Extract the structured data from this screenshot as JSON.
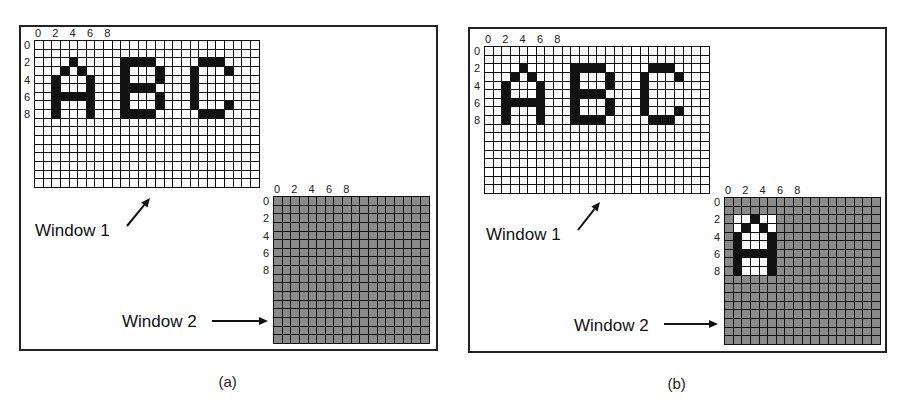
{
  "figure": {
    "panels": [
      {
        "id": "a",
        "caption": "(a)",
        "frame": {
          "x": 19,
          "y": 25,
          "w": 419,
          "h": 326
        },
        "window1": {
          "label": "Window 1",
          "x": 34,
          "y": 40,
          "cols": 26,
          "rows": 17,
          "fill": "white",
          "col_ticks": [
            "0",
            "2",
            "4",
            "6",
            "8"
          ],
          "row_ticks": [
            "0",
            "2",
            "4",
            "6",
            "8"
          ],
          "letters": [
            {
              "char": "A",
              "col": 2,
              "row": 2,
              "bitmap": [
                "..B..",
                ".B.B.",
                "B...B",
                "B...B",
                "BBBBB",
                "B...B",
                "B...B"
              ]
            },
            {
              "char": "B",
              "col": 10,
              "row": 2,
              "bitmap": [
                "BBBB.",
                "B...B",
                "B...B",
                "BBBB.",
                "B...B",
                "B...B",
                "BBBB."
              ]
            },
            {
              "char": "C",
              "col": 18,
              "row": 2,
              "bitmap": [
                ".BBB.",
                "B...B",
                "B....",
                "B....",
                "B....",
                "B...B",
                ".BBB."
              ]
            }
          ],
          "label_pos": {
            "x": 35,
            "y": 222
          },
          "arrow": {
            "x1": 127,
            "y1": 226,
            "x2": 150,
            "y2": 198
          }
        },
        "window2": {
          "label": "Window 2",
          "x": 273,
          "y": 196,
          "cols": 18,
          "rows": 17,
          "fill": "gray",
          "col_ticks": [
            "0",
            "2",
            "4",
            "6",
            "8"
          ],
          "row_ticks": [
            "0",
            "2",
            "4",
            "6",
            "8"
          ],
          "copied": null,
          "label_pos": {
            "x": 122,
            "y": 313
          },
          "arrow": {
            "x1": 212,
            "y1": 321,
            "x2": 268,
            "y2": 321
          }
        }
      },
      {
        "id": "b",
        "caption": "(b)",
        "frame": {
          "x": 468,
          "y": 27,
          "w": 419,
          "h": 326
        },
        "window1": {
          "label": "Window 1",
          "x": 484,
          "y": 46,
          "cols": 26,
          "rows": 17,
          "fill": "white",
          "col_ticks": [
            "0",
            "2",
            "4",
            "6",
            "8"
          ],
          "row_ticks": [
            "0",
            "2",
            "4",
            "6",
            "8"
          ],
          "letters": [
            {
              "char": "A",
              "col": 2,
              "row": 2,
              "bitmap": [
                "..B..",
                ".B.B.",
                "B...B",
                "B...B",
                "BBBBB",
                "B...B",
                "B...B"
              ]
            },
            {
              "char": "B",
              "col": 10,
              "row": 2,
              "bitmap": [
                "BBBB.",
                "B...B",
                "B...B",
                "BBBB.",
                "B...B",
                "B...B",
                "BBBB."
              ]
            },
            {
              "char": "C",
              "col": 18,
              "row": 2,
              "bitmap": [
                ".BBB.",
                "B...B",
                "B....",
                "B....",
                "B....",
                "B...B",
                ".BBB."
              ]
            }
          ],
          "label_pos": {
            "x": 486,
            "y": 226
          },
          "arrow": {
            "x1": 578,
            "y1": 230,
            "x2": 600,
            "y2": 202
          }
        },
        "window2": {
          "label": "Window 2",
          "x": 724,
          "y": 197,
          "cols": 18,
          "rows": 17,
          "fill": "gray",
          "col_ticks": [
            "0",
            "2",
            "4",
            "6",
            "8"
          ],
          "row_ticks": [
            "0",
            "2",
            "4",
            "6",
            "8"
          ],
          "copied": {
            "char": "A",
            "col": 1,
            "row": 2,
            "bitmap": [
              "..B..",
              ".B.B.",
              "B...B",
              "B...B",
              "BBBBB",
              "B...B",
              "B...B"
            ]
          },
          "label_pos": {
            "x": 574,
            "y": 317
          },
          "arrow": {
            "x1": 664,
            "y1": 324,
            "x2": 718,
            "y2": 324
          }
        }
      }
    ]
  }
}
